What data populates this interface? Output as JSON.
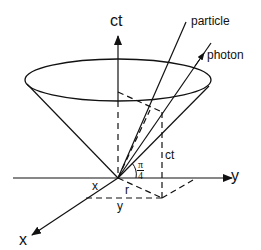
{
  "diagram": {
    "axes": {
      "time_axis_label": "ct",
      "y_axis_label": "y",
      "x_axis_label": "x"
    },
    "worldlines": {
      "particle_label": "particle",
      "photon_label": "photon"
    },
    "annotations": {
      "height_label": "ct",
      "angle_numerator": "π",
      "angle_denominator": "4",
      "x_component_label": "x",
      "y_component_label": "y",
      "radius_label": "r"
    },
    "colors": {
      "stroke": "#111111",
      "background": "#ffffff"
    }
  }
}
